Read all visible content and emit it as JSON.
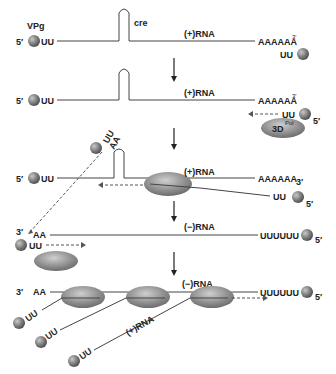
{
  "diagram": {
    "title": "",
    "labels": {
      "vpg": "VPg",
      "cre": "cre",
      "five_prime": "5′",
      "three_prime": "3′",
      "uu": "UU",
      "aa": "AA",
      "poly_a": "AAAAAA",
      "poly_u": "UUUUUU",
      "plus_rna": "(+)RNA",
      "minus_rna": "(−)RNA",
      "polymerase": "3D",
      "polymerase_sup": "Pol"
    },
    "steps": [
      {
        "id": 1,
        "description": "(+)RNA with 5′ VPg-UU, cre hairpin, 3′ poly(A); free VPg-UU"
      },
      {
        "id": 2,
        "description": "VPg-UU primer with 3D polymerase approaching 3′ poly(A)"
      },
      {
        "id": 3,
        "description": "(−)RNA synthesis by polymerase along (+)RNA template"
      },
      {
        "id": 4,
        "description": "(−)RNA with 3′ AA and 5′ VPg-UUUUUU; VPg-UU primer to 3′ end"
      },
      {
        "id": 5,
        "description": "Multiple polymerases synthesizing (+)RNA from (−)RNA template"
      }
    ],
    "colors": {
      "vpg_ball": "#7a7a7a",
      "polymerase": "#8e8e8e",
      "line": "#444444",
      "text": "#222222"
    }
  }
}
